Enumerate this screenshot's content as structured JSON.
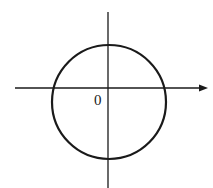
{
  "diagram": {
    "type": "coordinate-plane-with-circle",
    "origin_label": "0",
    "colors": {
      "stroke": "#1a1a1a",
      "background": "#ffffff"
    },
    "axes": {
      "x_axis": {
        "y": 88,
        "x_start": 15,
        "x_end": 207,
        "arrow": "right"
      },
      "y_axis": {
        "x": 108,
        "y_start": 12,
        "y_end": 188,
        "arrow": "none"
      }
    },
    "circle": {
      "cx": 109,
      "cy": 102,
      "r": 57,
      "stroke_width": 2.2
    },
    "origin_label_position": {
      "x": 94,
      "y": 93
    }
  }
}
